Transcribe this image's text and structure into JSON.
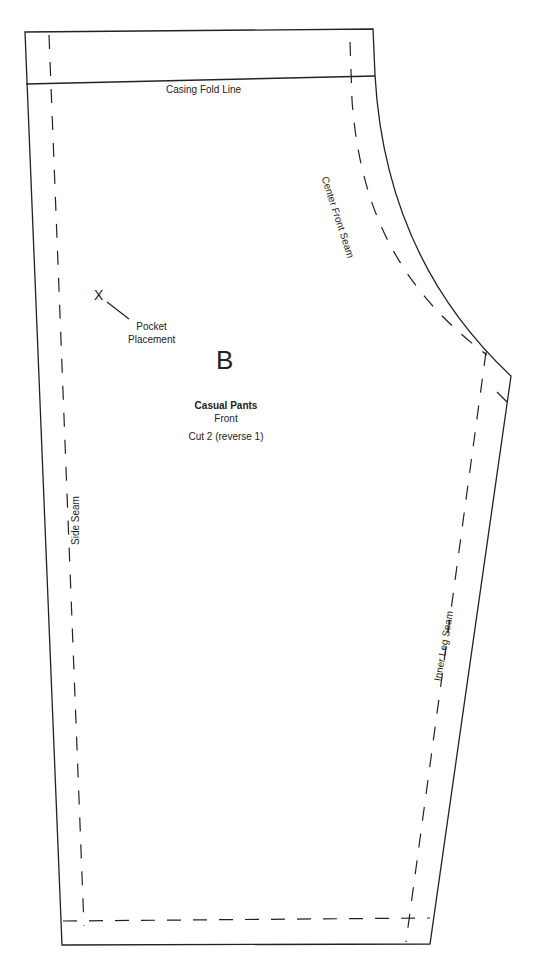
{
  "pattern": {
    "piece_letter": "B",
    "title": "Casual Pants",
    "subtitle": "Front",
    "cut_instruction": "Cut 2 (reverse 1)"
  },
  "labels": {
    "casing_fold_line": "Casing Fold Line",
    "center_front_seam": "Center Front Seam",
    "side_seam": "Side Seam",
    "inner_leg_seam": "Inner Leg Seam",
    "pocket_mark": "X",
    "pocket_placement_line1": "Pocket",
    "pocket_placement_line2": "Placement"
  },
  "colors": {
    "line": "#222222",
    "background": "#ffffff"
  }
}
